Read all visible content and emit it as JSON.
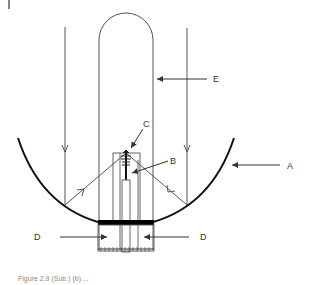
{
  "figure": {
    "labels": {
      "A": "A",
      "B": "B",
      "C": "C",
      "D_left": "D",
      "D_right": "D",
      "E": "E"
    },
    "caption": "Figure 2.9  (Sub.)  (b) ..."
  },
  "colors": {
    "line": "#555555",
    "reflector": "#111111",
    "absorber": "#000000",
    "label": "#333333"
  },
  "components": [
    {
      "id": "A",
      "description": "parabolic reflector"
    },
    {
      "id": "B",
      "description": "central rod / receiver stem"
    },
    {
      "id": "C",
      "description": "coil / top element"
    },
    {
      "id": "D",
      "description": "base plate supports"
    },
    {
      "id": "E",
      "description": "glass tube envelope"
    }
  ]
}
